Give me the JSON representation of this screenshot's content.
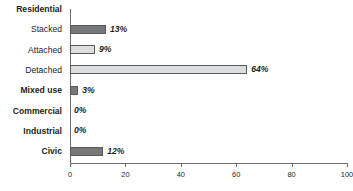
{
  "chart_data": {
    "type": "bar",
    "orientation": "horizontal",
    "title": "",
    "xlabel": "",
    "ylabel": "",
    "xlim": [
      0,
      100
    ],
    "xticks": [
      0,
      20,
      40,
      60,
      80,
      100
    ],
    "xtick_labels": [
      "0",
      "20",
      "40",
      "60",
      "80",
      "100"
    ],
    "grid": false,
    "legend": false,
    "group_header": "Residential",
    "categories": [
      "Residential",
      "Stacked",
      "Attached",
      "Detached",
      "Mixed use",
      "Commercial",
      "Industrial",
      "Civic"
    ],
    "values": [
      null,
      13,
      9,
      64,
      3,
      0,
      0,
      12
    ],
    "value_labels": [
      "",
      "13%",
      "9%",
      "64%",
      "3%",
      "0%",
      "0%",
      "12%"
    ],
    "bars": [
      {
        "category": "Residential",
        "value": null,
        "label": "",
        "shade": "none",
        "bold_label": true,
        "is_header": true
      },
      {
        "category": "Stacked",
        "value": 13,
        "label": "13%",
        "shade": "dark",
        "bold_label": false,
        "is_header": false
      },
      {
        "category": "Attached",
        "value": 9,
        "label": "9%",
        "shade": "light",
        "bold_label": false,
        "is_header": false
      },
      {
        "category": "Detached",
        "value": 64,
        "label": "64%",
        "shade": "light",
        "bold_label": false,
        "is_header": false
      },
      {
        "category": "Mixed use",
        "value": 3,
        "label": "3%",
        "shade": "dark",
        "bold_label": true,
        "is_header": false
      },
      {
        "category": "Commercial",
        "value": 0,
        "label": "0%",
        "shade": "none",
        "bold_label": true,
        "is_header": false
      },
      {
        "category": "Industrial",
        "value": 0,
        "label": "0%",
        "shade": "none",
        "bold_label": true,
        "is_header": false
      },
      {
        "category": "Civic",
        "value": 12,
        "label": "12%",
        "shade": "dark",
        "bold_label": true,
        "is_header": false
      }
    ],
    "colors": {
      "bar_dark": "#76787a",
      "bar_light": "#dcdddf",
      "bar_border": "#58595b",
      "axis": "#6d6e71",
      "text": "#231f20",
      "background": "#ffffff"
    }
  }
}
